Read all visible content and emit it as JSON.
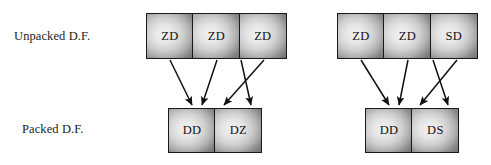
{
  "diagram": {
    "type": "flow",
    "title": "",
    "row_labels": {
      "unpacked": "Unpacked D.F.",
      "packed": "Packed D.F."
    },
    "colors": {
      "box_border": "#1a1a1a",
      "box_fill_light": "#f2f2f2",
      "box_fill_dark": "#7a7a7a",
      "arrow": "#111111",
      "text": "#111111",
      "background": "#ffffff"
    },
    "groups": [
      {
        "id": "left",
        "unpacked": {
          "cells": [
            {
              "label": "ZD"
            },
            {
              "label": "ZD"
            },
            {
              "label": "ZD"
            }
          ]
        },
        "packed": {
          "cells": [
            {
              "label": "DD"
            },
            {
              "label": "DZ"
            }
          ]
        }
      },
      {
        "id": "right",
        "unpacked": {
          "cells": [
            {
              "label": "ZD"
            },
            {
              "label": "ZD"
            },
            {
              "label": "SD"
            }
          ]
        },
        "packed": {
          "cells": [
            {
              "label": "DD"
            },
            {
              "label": "DS"
            }
          ]
        }
      }
    ],
    "arrows": [
      {
        "group": "left",
        "from_x": 170,
        "from_y": 60,
        "to_x": 192,
        "to_y": 105
      },
      {
        "group": "left",
        "from_x": 217,
        "from_y": 60,
        "to_x": 202,
        "to_y": 105
      },
      {
        "group": "left",
        "from_x": 241,
        "from_y": 60,
        "to_x": 251,
        "to_y": 105
      },
      {
        "group": "left",
        "from_x": 264,
        "from_y": 60,
        "to_x": 224,
        "to_y": 105
      },
      {
        "group": "right",
        "from_x": 361,
        "from_y": 60,
        "to_x": 389,
        "to_y": 105
      },
      {
        "group": "right",
        "from_x": 408,
        "from_y": 60,
        "to_x": 399,
        "to_y": 105
      },
      {
        "group": "right",
        "from_x": 433,
        "from_y": 60,
        "to_x": 448,
        "to_y": 105
      },
      {
        "group": "right",
        "from_x": 457,
        "from_y": 60,
        "to_x": 420,
        "to_y": 105
      }
    ]
  }
}
